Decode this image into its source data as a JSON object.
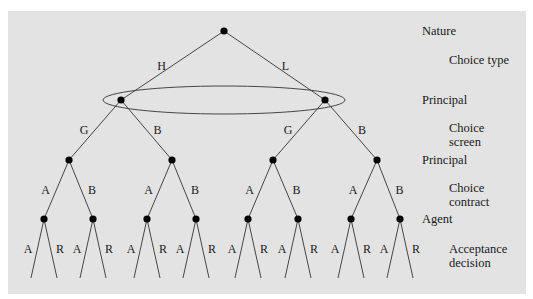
{
  "diagram": {
    "type": "game-tree",
    "colors": {
      "panel": "#e3e3e3",
      "line": "#333333",
      "node": "#000000",
      "text": "#1a1a1a"
    },
    "root": {
      "x": 224,
      "y": 31,
      "player": "Nature"
    },
    "level1": {
      "edge_labels": [
        "H",
        "L"
      ],
      "nodes": [
        {
          "x": 121,
          "y": 100
        },
        {
          "x": 325,
          "y": 100
        }
      ],
      "information_set": {
        "cx": 224,
        "cy": 100,
        "rx": 121,
        "ry": 14
      }
    },
    "level2": {
      "edge_labels": [
        "G",
        "B",
        "G",
        "B"
      ],
      "nodes": [
        {
          "x": 69,
          "y": 160
        },
        {
          "x": 172,
          "y": 160
        },
        {
          "x": 273,
          "y": 160
        },
        {
          "x": 377,
          "y": 160
        }
      ]
    },
    "level3": {
      "edge_labels": [
        "A",
        "B",
        "A",
        "B",
        "A",
        "B",
        "A",
        "B"
      ],
      "nodes": [
        {
          "x": 44,
          "y": 219
        },
        {
          "x": 93,
          "y": 219
        },
        {
          "x": 147,
          "y": 219
        },
        {
          "x": 196,
          "y": 219
        },
        {
          "x": 248,
          "y": 219
        },
        {
          "x": 298,
          "y": 219
        },
        {
          "x": 351,
          "y": 219
        },
        {
          "x": 400,
          "y": 219
        }
      ]
    },
    "leaves": {
      "edge_labels": [
        "A",
        "R"
      ],
      "spread": 13,
      "y": 278
    }
  },
  "stage_labels": [
    {
      "lines": [
        "Nature"
      ],
      "x": 422,
      "y": 35
    },
    {
      "lines": [
        "Choice type"
      ],
      "x": 449,
      "y": 64
    },
    {
      "lines": [
        "Principal"
      ],
      "x": 422,
      "y": 104
    },
    {
      "lines": [
        "Choice",
        "screen"
      ],
      "x": 449,
      "y": 132
    },
    {
      "lines": [
        "Principal"
      ],
      "x": 422,
      "y": 164
    },
    {
      "lines": [
        "Choice",
        "contract"
      ],
      "x": 449,
      "y": 192
    },
    {
      "lines": [
        "Agent"
      ],
      "x": 422,
      "y": 223
    },
    {
      "lines": [
        "Acceptance",
        "decision"
      ],
      "x": 449,
      "y": 253
    }
  ]
}
